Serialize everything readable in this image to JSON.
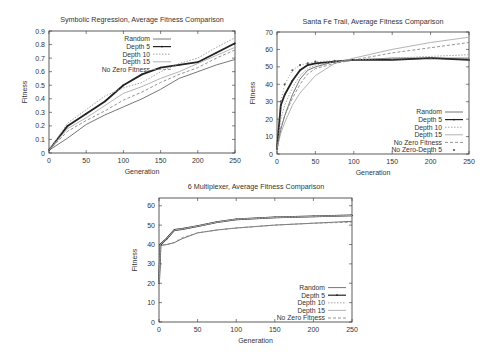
{
  "chart_data": [
    {
      "type": "line",
      "title": "Symbolic Regression, Average Fitness Comparison",
      "xlabel": "Generation",
      "ylabel": "Fitness",
      "xlim": [
        0,
        250
      ],
      "ylim": [
        0,
        0.9
      ],
      "xticks": [
        0,
        50,
        100,
        150,
        200,
        250
      ],
      "yticks": [
        0,
        0.1,
        0.2,
        0.3,
        0.4,
        0.5,
        0.6,
        0.7,
        0.8,
        0.9
      ],
      "ytick_labels": [
        "0",
        "0.1",
        "0.2",
        "0.3",
        "0.4",
        "0.5",
        "0.6",
        "0.7",
        "0.8",
        "0.9"
      ],
      "legend_position": "upper left",
      "x": [
        0,
        25,
        50,
        75,
        100,
        125,
        150,
        175,
        200,
        225,
        250
      ],
      "series": [
        {
          "name": "Random",
          "style": "solid-gray",
          "values": [
            0.02,
            0.11,
            0.21,
            0.28,
            0.34,
            0.4,
            0.47,
            0.55,
            0.6,
            0.65,
            0.69
          ]
        },
        {
          "name": "Depth 5",
          "style": "thick-dark",
          "values": [
            0.02,
            0.2,
            0.29,
            0.38,
            0.5,
            0.58,
            0.63,
            0.65,
            0.67,
            0.74,
            0.81
          ]
        },
        {
          "name": "Depth 10",
          "style": "dotted",
          "values": [
            0.02,
            0.22,
            0.32,
            0.42,
            0.48,
            0.52,
            0.6,
            0.66,
            0.7,
            0.78,
            0.85
          ]
        },
        {
          "name": "Depth 15",
          "style": "light",
          "values": [
            0.02,
            0.18,
            0.26,
            0.35,
            0.44,
            0.49,
            0.55,
            0.6,
            0.66,
            0.72,
            0.78
          ]
        },
        {
          "name": "No Zero Fitness",
          "style": "dashed",
          "values": [
            0.02,
            0.16,
            0.24,
            0.31,
            0.39,
            0.45,
            0.52,
            0.58,
            0.63,
            0.7,
            0.76
          ]
        }
      ]
    },
    {
      "type": "line",
      "title": "Santa Fe Trail, Average Fitness Comparison",
      "xlabel": "Generation",
      "ylabel": "Fitness",
      "xlim": [
        0,
        250
      ],
      "ylim": [
        0,
        70
      ],
      "xticks": [
        0,
        50,
        100,
        150,
        200,
        250
      ],
      "yticks": [
        0,
        10,
        20,
        30,
        40,
        50,
        60,
        70
      ],
      "ytick_labels": [
        "0",
        "10",
        "20",
        "30",
        "40",
        "50",
        "60",
        "70"
      ],
      "legend_position": "lower right",
      "x": [
        0,
        5,
        10,
        20,
        30,
        40,
        50,
        75,
        100,
        150,
        200,
        250
      ],
      "series": [
        {
          "name": "Random",
          "style": "solid-gray",
          "values": [
            3,
            14,
            22,
            34,
            43,
            48,
            50,
            53,
            54,
            55,
            55,
            55
          ]
        },
        {
          "name": "Depth 5",
          "style": "thick-dark",
          "values": [
            3,
            28,
            34,
            42,
            48,
            51,
            52,
            53,
            54,
            54,
            55,
            54
          ]
        },
        {
          "name": "Depth 10",
          "style": "dotted",
          "values": [
            3,
            20,
            28,
            38,
            45,
            49,
            51,
            53,
            54,
            55,
            56,
            57
          ]
        },
        {
          "name": "Depth 15",
          "style": "light",
          "values": [
            3,
            12,
            18,
            28,
            35,
            40,
            45,
            52,
            55,
            60,
            64,
            67
          ]
        },
        {
          "name": "No Zero Fitness",
          "style": "dashed",
          "values": [
            3,
            15,
            22,
            32,
            40,
            46,
            49,
            52,
            54,
            58,
            61,
            64
          ]
        },
        {
          "name": "No Zero-Depth 5",
          "style": "points",
          "values": [
            3,
            30,
            40,
            48,
            51,
            52,
            53,
            53.5,
            54,
            54,
            55,
            54
          ]
        }
      ]
    },
    {
      "type": "line",
      "title": "6 Multiplexer, Average Fitness Comparison",
      "xlabel": "Generation",
      "ylabel": "Fitness",
      "xlim": [
        0,
        250
      ],
      "ylim": [
        0,
        64
      ],
      "xticks": [
        0,
        50,
        100,
        150,
        200,
        250
      ],
      "yticks": [
        0,
        10,
        20,
        30,
        40,
        50,
        60
      ],
      "ytick_labels": [
        "0",
        "10",
        "20",
        "30",
        "40",
        "50",
        "60"
      ],
      "legend_position": "lower right",
      "x": [
        0,
        2,
        10,
        20,
        30,
        50,
        75,
        100,
        150,
        200,
        250
      ],
      "series": [
        {
          "name": "Random",
          "style": "solid-gray",
          "values": [
            20,
            39.5,
            40,
            41,
            43,
            46,
            47.5,
            48.5,
            50,
            51,
            52
          ]
        },
        {
          "name": "Depth 5",
          "style": "thick-dark",
          "values": [
            20,
            40,
            43,
            47.5,
            48,
            49.5,
            51.5,
            53,
            54,
            54.5,
            55
          ]
        },
        {
          "name": "Depth 10",
          "style": "dotted",
          "values": [
            20,
            40,
            43,
            47.5,
            48,
            49.5,
            51.5,
            53,
            54,
            54.5,
            55
          ]
        },
        {
          "name": "Depth 15",
          "style": "light",
          "values": [
            20,
            40,
            43,
            47.5,
            48,
            49.5,
            51.5,
            53,
            54,
            54.5,
            55
          ]
        },
        {
          "name": "No Zero Fitness",
          "style": "dashed",
          "values": [
            20,
            39.5,
            40,
            41,
            43.5,
            46,
            47.5,
            48.5,
            50,
            51,
            51.5
          ]
        }
      ]
    }
  ],
  "layout": [
    {
      "plot": {
        "x0": 49,
        "x1": 235,
        "y0": 31,
        "y1": 153
      },
      "title_pos": [
        142,
        22
      ]
    },
    {
      "plot": {
        "x0": 277,
        "x1": 469,
        "y0": 32,
        "y1": 154
      },
      "title_pos": [
        373,
        24
      ]
    },
    {
      "plot": {
        "x0": 159,
        "x1": 352,
        "y0": 198,
        "y1": 322
      },
      "title_pos": [
        256,
        189
      ]
    }
  ]
}
